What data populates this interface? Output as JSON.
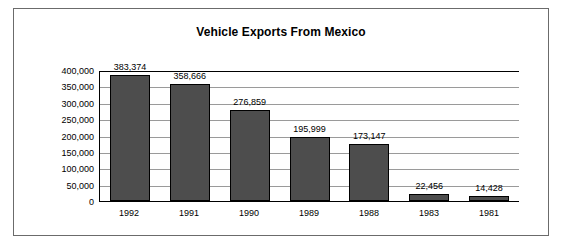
{
  "chart_data": {
    "type": "bar",
    "title": "Vehicle Exports From Mexico",
    "xlabel": "",
    "ylabel": "",
    "grid": true,
    "legend": "none",
    "categories": [
      "1992",
      "1991",
      "1990",
      "1989",
      "1988",
      "1983",
      "1981"
    ],
    "values": [
      383374,
      358666,
      276859,
      195999,
      173147,
      22456,
      14428
    ],
    "value_labels": [
      "383,374",
      "358,666",
      "276,859",
      "195,999",
      "173,147",
      "22,456",
      "14,428"
    ],
    "ylim": [
      0,
      400000
    ],
    "yticks": [
      0,
      50000,
      100000,
      150000,
      200000,
      250000,
      300000,
      350000,
      400000
    ],
    "ytick_labels": [
      "0",
      "50,000",
      "100,000",
      "150,000",
      "200,000",
      "250,000",
      "300,000",
      "350,000",
      "400,000"
    ],
    "bar_color": "#4d4d4d",
    "bar_edge_color": "#000000",
    "axis_color": "#000000",
    "grid_color": "#9a9a9a",
    "frame_color": "#6b6b6b",
    "background": "#ffffff"
  }
}
